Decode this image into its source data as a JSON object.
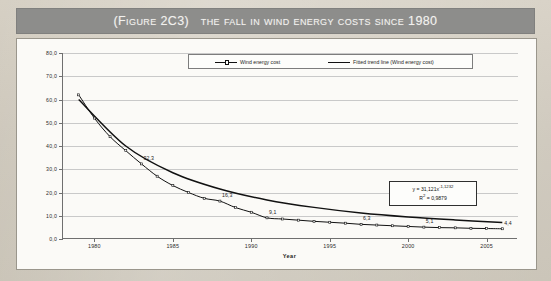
{
  "figure": {
    "title_prefix": "(Figure 2C3)",
    "title_main": "The fall in wind energy costs since 1980"
  },
  "chart_data": {
    "type": "line",
    "title": "The fall in wind energy costs since 1980",
    "xlabel": "Year",
    "ylabel": "",
    "xlim": [
      1978,
      2007
    ],
    "ylim": [
      0.0,
      80.0
    ],
    "grid": true,
    "legend_position": "top-center",
    "ytick_labels": [
      "0,0",
      "10,0",
      "20,0",
      "30,0",
      "40,0",
      "50,0",
      "60,0",
      "70,0",
      "80,0"
    ],
    "ytick_values": [
      0,
      10,
      20,
      30,
      40,
      50,
      60,
      70,
      80
    ],
    "xtick_labels": [
      "1980",
      "1985",
      "1990",
      "1995",
      "2000",
      "2005"
    ],
    "xtick_values": [
      1980,
      1985,
      1990,
      1995,
      2000,
      2005
    ],
    "series": [
      {
        "name": "Wind energy cost",
        "x": [
          1979,
          1980,
          1981,
          1982,
          1983,
          1984,
          1985,
          1986,
          1987,
          1988,
          1989,
          1990,
          1991,
          1992,
          1993,
          1994,
          1995,
          1996,
          1997,
          1998,
          1999,
          2000,
          2001,
          2002,
          2003,
          2004,
          2005,
          2006
        ],
        "values": [
          62.0,
          52.0,
          44.0,
          38.0,
          32.3,
          27.0,
          23.0,
          20.0,
          17.5,
          16.3,
          13.5,
          11.5,
          9.1,
          8.6,
          8.1,
          7.6,
          7.2,
          6.8,
          6.3,
          6.0,
          5.7,
          5.4,
          5.1,
          4.9,
          4.8,
          4.6,
          4.5,
          4.4
        ]
      },
      {
        "name": "Fitted trend line (Wind energy cost)",
        "x": [
          1979,
          1982,
          1985,
          1988,
          1991,
          1994,
          1997,
          2000,
          2003,
          2006
        ],
        "values": [
          60.0,
          40.0,
          28.5,
          21.5,
          16.8,
          13.6,
          11.2,
          9.5,
          8.2,
          7.1
        ]
      }
    ],
    "data_labels": [
      {
        "text": "32,3",
        "x": 1983,
        "y": 32.3
      },
      {
        "text": "16,3",
        "x": 1988,
        "y": 16.3
      },
      {
        "text": "9,1",
        "x": 1991,
        "y": 9.1
      },
      {
        "text": "6,3",
        "x": 1997,
        "y": 6.3
      },
      {
        "text": "5,1",
        "x": 2001,
        "y": 5.1
      },
      {
        "text": "4,4",
        "x": 2006,
        "y": 4.4
      }
    ],
    "annotations": {
      "equation": "y = 31,121x",
      "equation_exponent": "-1,1232",
      "r_squared": "R2 = 0,9879",
      "r_squared_base": "R",
      "r_squared_sup": "2",
      "r_squared_value": " = 0,9879"
    }
  },
  "colors": {
    "title_band": "#8d8d8b",
    "title_text": "#f2f1ee",
    "panel": "#fbfaf7",
    "page": "#cfc9bd",
    "axis": "#6f6f6f",
    "grid": "#c9c9c9",
    "series": "#111111"
  }
}
